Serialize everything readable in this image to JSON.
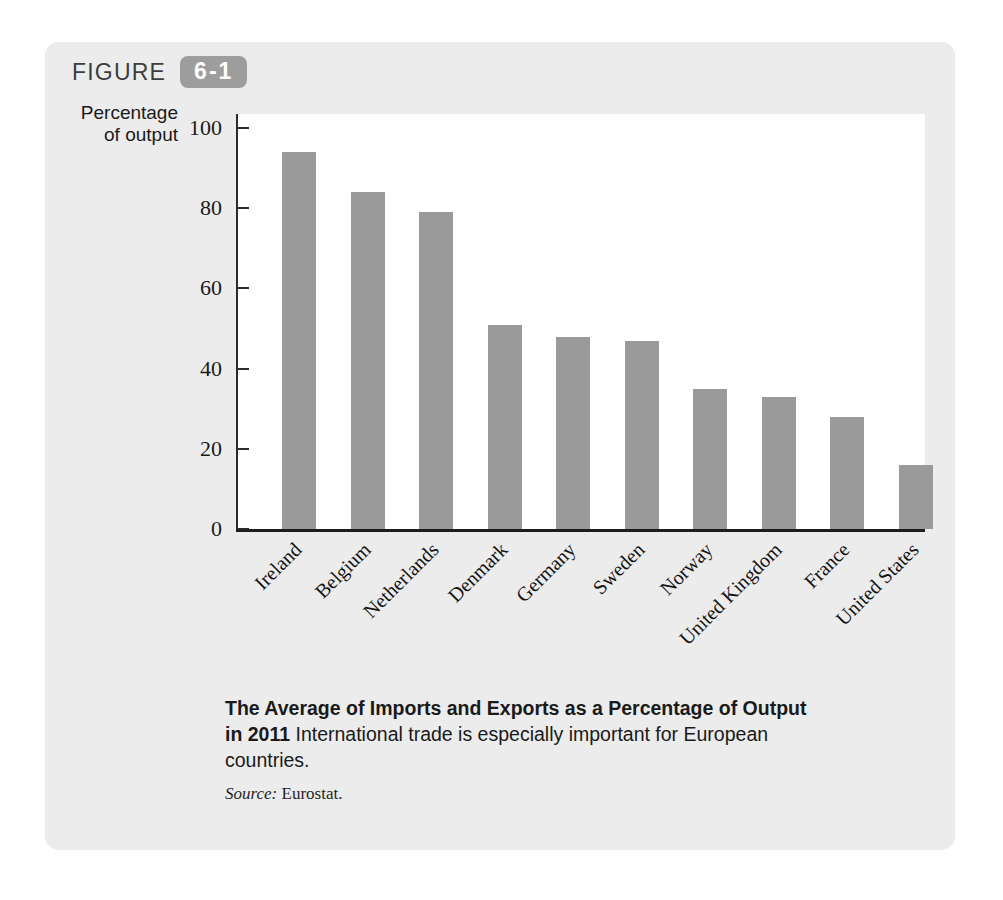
{
  "figure": {
    "label": "FIGURE",
    "number": "6-1",
    "badge_color": "#9d9d9d",
    "card_color": "#ececec"
  },
  "axis_title_line1": "Percentage",
  "axis_title_line2": "of output",
  "caption": {
    "bold": "The Average of Imports and Exports as a Percentage of Output in 2011",
    "rest": "International trade is especially important for European countries.",
    "source_label": "Source:",
    "source_value": "Eurostat."
  },
  "chart_data": {
    "type": "bar",
    "title": "The Average of Imports and Exports as a Percentage of Output in 2011",
    "xlabel": "",
    "ylabel": "Percentage of output",
    "ylim": [
      0,
      100
    ],
    "yticks": [
      100,
      80,
      60,
      40,
      20,
      0
    ],
    "grid": false,
    "legend": "none",
    "bar_color": "#9a9a9a",
    "categories": [
      "Ireland",
      "Belgium",
      "Netherlands",
      "Denmark",
      "Germany",
      "Sweden",
      "Norway",
      "United Kingdom",
      "France",
      "United States"
    ],
    "values": [
      94,
      84,
      79,
      51,
      48,
      47,
      35,
      33,
      28,
      16
    ],
    "source": "Eurostat"
  },
  "page_ghost": {
    "heading": "The Open Economy",
    "line_a": "international trade of goods and services",
    "line_b": "open economy",
    "line_c": "macroeconomic analysis",
    "line_d": "International Flows of Capital and Goods",
    "line_e": "The key macroeconomic difference between open and closed economies is with",
    "line_f": "an open economy, a country's spending in any given year need not equal its",
    "line_g": "output of goods and services. A country can spend more than it produces by"
  }
}
